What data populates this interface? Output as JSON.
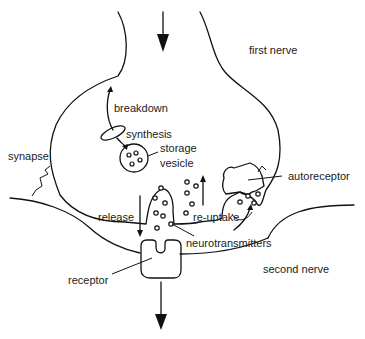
{
  "diagram": {
    "type": "synapse-schematic",
    "labels": {
      "first_nerve": "first nerve",
      "second_nerve": "second nerve",
      "breakdown": "breakdown",
      "synthesis": "synthesis",
      "storage": "storage",
      "vesicle": "vesicle",
      "synapse": "synapse",
      "autoreceptor": "autoreceptor",
      "release": "release",
      "re_uptake": "re-uptake",
      "neurotransmitters": "neurotransmitters",
      "receptor": "receptor"
    },
    "arrows": {
      "signal_in": "down",
      "signal_out": "down"
    },
    "colors": {
      "stroke": "#111111",
      "text": "#222222",
      "background": "#ffffff"
    }
  }
}
